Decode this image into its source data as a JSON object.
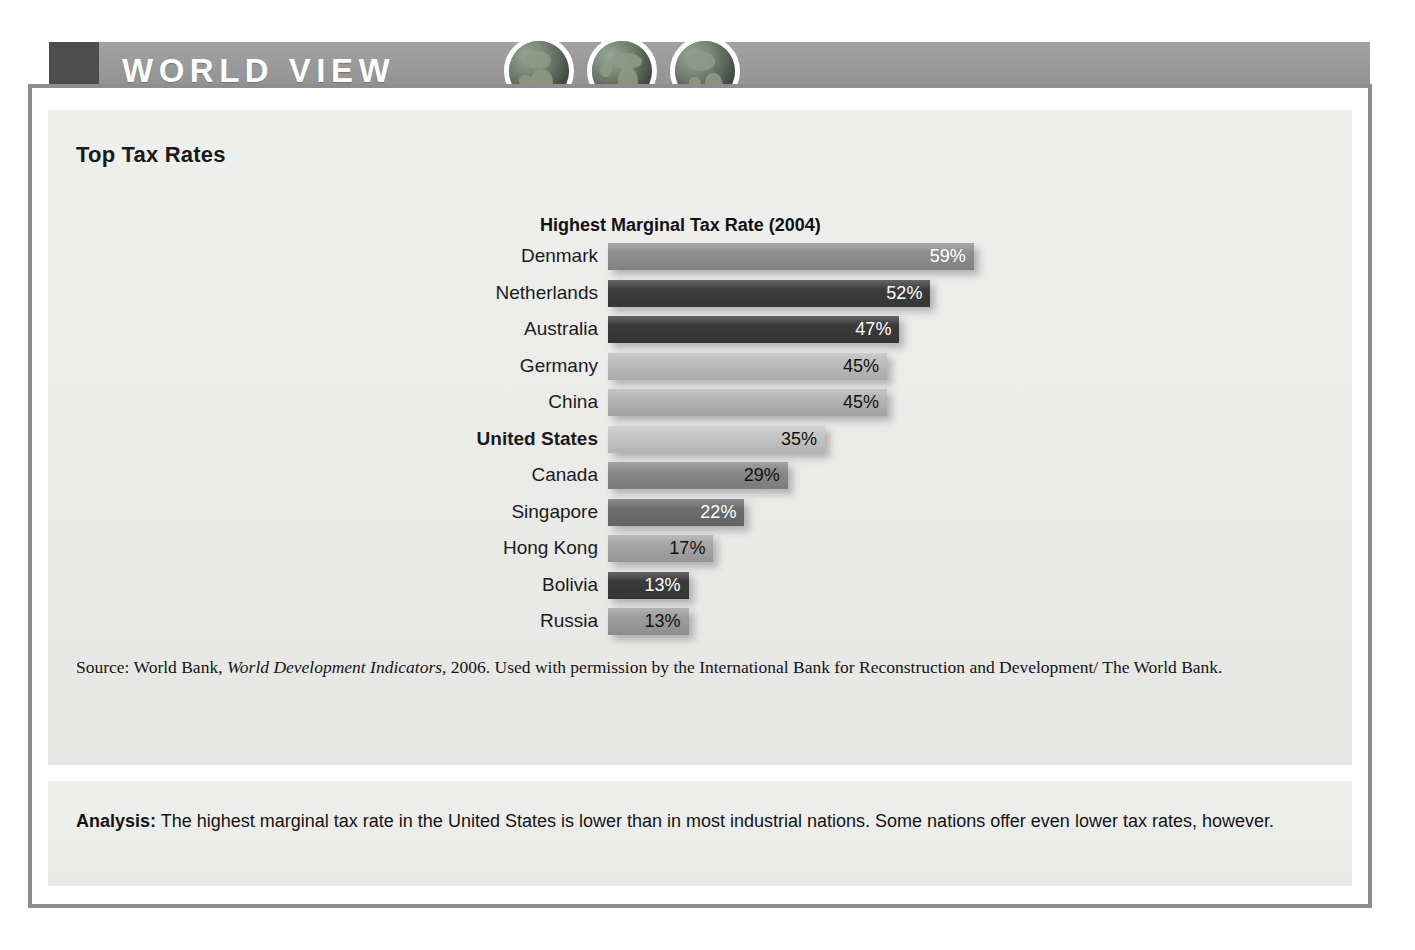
{
  "header": {
    "title": "WORLD VIEW",
    "globes": [
      "globe-africa-icon",
      "globe-europe-africa-icon",
      "globe-americas-icon"
    ],
    "band_color": "#9b9b9b",
    "block_color": "#4d4d4d"
  },
  "section": {
    "title": "Top Tax Rates"
  },
  "chart_data": {
    "type": "bar",
    "orientation": "horizontal",
    "title": "Highest Marginal Tax Rate (2004)",
    "xlabel": "",
    "ylabel": "",
    "xlim": [
      0,
      60
    ],
    "grid": false,
    "legend": null,
    "categories": [
      "Denmark",
      "Netherlands",
      "Australia",
      "Germany",
      "China",
      "United States",
      "Canada",
      "Singapore",
      "Hong Kong",
      "Bolivia",
      "Russia"
    ],
    "values": [
      59,
      52,
      47,
      45,
      45,
      35,
      29,
      22,
      17,
      13,
      13
    ],
    "value_labels": [
      "59%",
      "52%",
      "47%",
      "45%",
      "45%",
      "35%",
      "29%",
      "22%",
      "17%",
      "13%",
      "13%"
    ],
    "bar_colors": [
      "#8f8f8f",
      "#3c3c3c",
      "#3a3a3a",
      "#bdbdbd",
      "#b5b5b5",
      "#c6c6c6",
      "#898989",
      "#6e6e6e",
      "#a6a6a6",
      "#3b3b3b",
      "#9d9d9d"
    ],
    "label_text_colors": [
      "#ffffff",
      "#ffffff",
      "#ffffff",
      "#111111",
      "#111111",
      "#111111",
      "#111111",
      "#ffffff",
      "#111111",
      "#ffffff",
      "#111111"
    ],
    "highlight_category": "United States"
  },
  "source": {
    "prefix": "Source: World Bank, ",
    "italic": "World Development Indicators,",
    "suffix": " 2006. Used with permission by the International Bank for Reconstruction and Development/ The World Bank."
  },
  "analysis": {
    "label": "Analysis:",
    "text": " The highest marginal tax rate in the United States is lower than in most industrial nations. Some nations offer even lower tax rates, however."
  }
}
